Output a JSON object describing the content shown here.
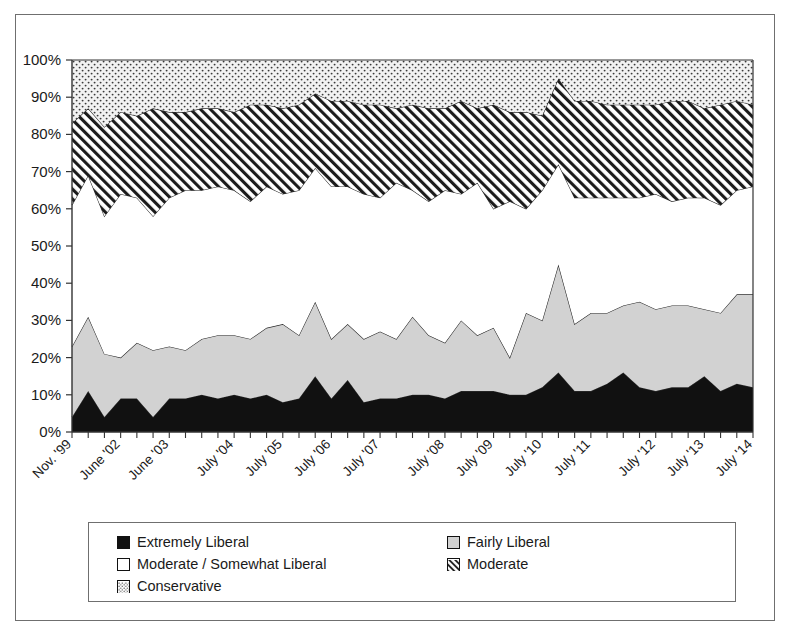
{
  "chart_data": {
    "type": "area",
    "stacked": true,
    "title": "",
    "xlabel": "",
    "ylabel": "",
    "ylim": [
      0,
      100
    ],
    "y_tick_labels": [
      "0%",
      "10%",
      "20%",
      "30%",
      "40%",
      "50%",
      "60%",
      "70%",
      "80%",
      "90%",
      "100%"
    ],
    "y_tick_values": [
      0,
      10,
      20,
      30,
      40,
      50,
      60,
      70,
      80,
      90,
      100
    ],
    "x_tick_labels": [
      "Nov. '99",
      "June '02",
      "June '03",
      "July '04",
      "July '05",
      "July '06",
      "July '07",
      "July '08",
      "July '09",
      "July '10",
      "July '11",
      "July '12",
      "July '13",
      "July '14"
    ],
    "x_tick_label_rotation_deg": 45,
    "grid": false,
    "legend_position": "bottom",
    "n_points": 43,
    "series": [
      {
        "name": "Extremely Liberal",
        "fill": "#111111",
        "pattern": "solid",
        "values": [
          4,
          11,
          4,
          9,
          9,
          4,
          9,
          9,
          10,
          9,
          10,
          9,
          10,
          8,
          9,
          15,
          9,
          14,
          8,
          9,
          9,
          10,
          10,
          9,
          11,
          11,
          11,
          10,
          10,
          12,
          16,
          11,
          11,
          13,
          16,
          12,
          11,
          12,
          12,
          15,
          11,
          13,
          12
        ]
      },
      {
        "name": "Fairly Liberal",
        "fill": "#d2d2d2",
        "pattern": "solid",
        "values": [
          19,
          20,
          17,
          11,
          15,
          18,
          14,
          13,
          15,
          17,
          16,
          16,
          18,
          21,
          17,
          20,
          16,
          15,
          17,
          18,
          16,
          21,
          16,
          15,
          19,
          15,
          17,
          10,
          22,
          18,
          29,
          18,
          21,
          19,
          18,
          23,
          22,
          22,
          22,
          18,
          21,
          24,
          25
        ]
      },
      {
        "name": "Moderate / Somewhat Liberal",
        "fill": "#ffffff",
        "pattern": "none",
        "values": [
          38,
          38,
          37,
          44,
          39,
          36,
          40,
          43,
          40,
          40,
          39,
          37,
          38,
          35,
          39,
          36,
          41,
          37,
          39,
          36,
          42,
          34,
          36,
          41,
          34,
          41,
          32,
          42,
          28,
          35,
          27,
          34,
          31,
          31,
          29,
          28,
          31,
          28,
          29,
          30,
          29,
          28,
          29
        ]
      },
      {
        "name": "Moderate",
        "fill": "#ffffff",
        "pattern": "diagonal-hatch",
        "values": [
          22,
          18,
          24,
          22,
          22,
          29,
          23,
          21,
          22,
          21,
          21,
          26,
          22,
          23,
          23,
          20,
          23,
          23,
          24,
          25,
          20,
          23,
          25,
          22,
          25,
          20,
          28,
          24,
          26,
          20,
          23,
          26,
          26,
          25,
          25,
          25,
          24,
          27,
          26,
          24,
          27,
          24,
          22
        ]
      },
      {
        "name": "Conservative",
        "fill": "#ffffff",
        "pattern": "dots",
        "values": [
          17,
          13,
          18,
          14,
          15,
          13,
          14,
          14,
          13,
          13,
          14,
          12,
          12,
          13,
          12,
          9,
          11,
          11,
          12,
          12,
          13,
          12,
          13,
          13,
          11,
          13,
          12,
          14,
          14,
          15,
          5,
          11,
          11,
          12,
          12,
          12,
          12,
          11,
          11,
          13,
          12,
          11,
          12
        ]
      }
    ]
  },
  "legend": {
    "items": [
      {
        "label": "Extremely Liberal",
        "swatch": "swatch-black"
      },
      {
        "label": "Fairly Liberal",
        "swatch": "swatch-gray"
      },
      {
        "label": "Moderate / Somewhat Liberal",
        "swatch": "swatch-white"
      },
      {
        "label": "Moderate",
        "swatch": "swatch-hatch"
      },
      {
        "label": "Conservative",
        "swatch": "swatch-dots"
      }
    ]
  }
}
